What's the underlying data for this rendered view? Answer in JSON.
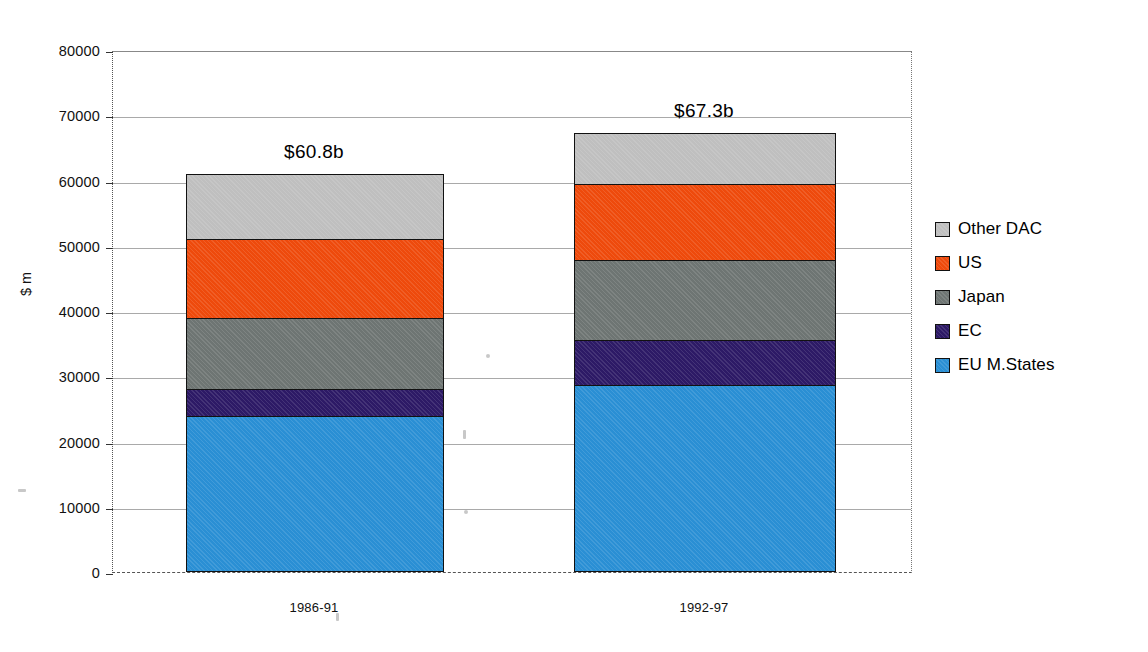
{
  "chart_data": {
    "type": "bar",
    "subtype": "stacked-vertical",
    "title": "",
    "xlabel": "",
    "ylabel": "$ m",
    "ylim": [
      0,
      80000
    ],
    "yticks": [
      0,
      10000,
      20000,
      30000,
      40000,
      50000,
      60000,
      70000,
      80000
    ],
    "ytick_labels": [
      "0",
      "10000",
      "20000",
      "30000",
      "40000",
      "50000",
      "60000",
      "70000",
      "80000"
    ],
    "grid": "horizontal",
    "legend_position": "right",
    "categories": [
      "1986-91",
      "1992-97"
    ],
    "series": [
      {
        "name": "EU M.States",
        "color": "#2a8fd4",
        "values": [
          23900,
          28700
        ]
      },
      {
        "name": "EC",
        "color": "#2d1a66",
        "values": [
          4100,
          6800
        ]
      },
      {
        "name": "Japan",
        "color": "#6e7573",
        "values": [
          10900,
          12300
        ]
      },
      {
        "name": "US",
        "color": "#ee4a0c",
        "values": [
          12200,
          11700
        ]
      },
      {
        "name": "Other DAC",
        "color": "#bfbfbf",
        "values": [
          9900,
          7800
        ]
      }
    ],
    "stack_order_bottom_to_top": [
      "EU M.States",
      "EC",
      "Japan",
      "US",
      "Other DAC"
    ],
    "totals": [
      61000,
      67300
    ],
    "bar_labels": [
      "$60.8b",
      "$67.3b"
    ],
    "annotations": []
  },
  "legend": {
    "items": [
      {
        "label": "Other DAC",
        "color": "#bfbfbf"
      },
      {
        "label": "US",
        "color": "#ee4a0c"
      },
      {
        "label": "Japan",
        "color": "#6e7573"
      },
      {
        "label": "EC",
        "color": "#2d1a66"
      },
      {
        "label": "EU M.States",
        "color": "#2a8fd4"
      }
    ]
  }
}
